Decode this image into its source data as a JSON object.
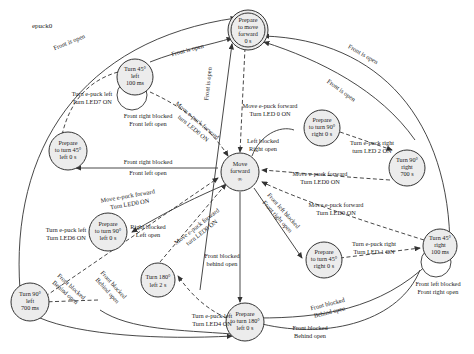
{
  "diagram": {
    "title": "epuck0",
    "type": "state-machine",
    "colors": {
      "node_fill": "#ececec",
      "stroke": "#333333",
      "text": "#222222",
      "background": "#ffffff"
    },
    "nodes": [
      {
        "id": "prepare_forward",
        "lines": [
          "Prepare",
          "to move",
          "forward",
          "0 s"
        ],
        "double": true
      },
      {
        "id": "turn45_left",
        "lines": [
          "Turn 45°",
          "left",
          "100 ms"
        ]
      },
      {
        "id": "prepare45_left",
        "lines": [
          "Prepare",
          "to turn 45°",
          "left 0 s"
        ]
      },
      {
        "id": "move_forward",
        "lines": [
          "Move",
          "forward",
          "∞"
        ]
      },
      {
        "id": "turn90_left",
        "lines": [
          "Turn 90°",
          "left",
          "700 ms"
        ]
      },
      {
        "id": "prepare90_left",
        "lines": [
          "Prepare",
          "to turn 90°",
          "left 0 s"
        ]
      },
      {
        "id": "turn180_left",
        "lines": [
          "Turn 180°",
          "left 2 s"
        ]
      },
      {
        "id": "prepare180_left",
        "lines": [
          "Prepare",
          "to turn 180°",
          "left 0 s"
        ]
      },
      {
        "id": "prepare90_right",
        "lines": [
          "Prepare",
          "to turn 90°",
          "right 0 s"
        ]
      },
      {
        "id": "turn90_right",
        "lines": [
          "Turn 90°",
          "right",
          "700 s"
        ]
      },
      {
        "id": "prepare45_right",
        "lines": [
          "Prepare",
          "to turn 45°",
          "right 0 s"
        ]
      },
      {
        "id": "turn45_right",
        "lines": [
          "Turn 45°",
          "right",
          "100 ms"
        ]
      }
    ],
    "labels": {
      "front_open_outer_left": "Front is open",
      "front_open_t45l": "Front is open",
      "front_open_vertical": "Front is open",
      "front_open_outer_right": "Front is open",
      "front_open_t90r": "Front is open",
      "move_fwd_led0_top": [
        "Move e-puck forward",
        "Turn LED 0 ON"
      ],
      "turn_left_led7": [
        "Turn e-puck left",
        "Turn LED7 ON"
      ],
      "loop_t45l": [
        "Front right blocked",
        "Front left open"
      ],
      "move_fwd_led0_t45l": [
        "Move e-puck forward",
        "turn LED0 ON"
      ],
      "frb_flo_mid": [
        "Front right blocked",
        "Front left open"
      ],
      "move_fwd_led0_t90l": [
        "Move e-puck forward",
        "Turn LED0 ON"
      ],
      "turn_left_led6": [
        "Turn e-puck left",
        "Turn LED6 ON"
      ],
      "right_blocked": [
        "Right blocked",
        "Left open"
      ],
      "move_fwd_led0_t180": [
        "Move e-puck forward",
        "turn LED0 ON"
      ],
      "left_blocked": [
        "Left blocked",
        "Right open"
      ],
      "turn_right_led2": [
        "Turn e-puck right",
        "turn LED 2 ON"
      ],
      "move_fwd_led0_t90r": [
        "Move e-puck forward",
        "Turn LED0 ON"
      ],
      "move_fwd_led0_t45r": [
        "Move e-puck forward",
        "Turn LED0 ON"
      ],
      "flb_fro_diag": [
        "Front left blocked",
        "Front right open"
      ],
      "front_blocked_behind": [
        "Front blocked",
        "behind open"
      ],
      "turn_right_led1": [
        "Turn e-puck right",
        "Turn LED 1 ON"
      ],
      "loop_t45r": [
        "Front left blocked",
        "Front right open"
      ],
      "turn_left_led4": [
        "Turn e-puck left",
        "Turn LED4 ON"
      ],
      "fb_bo_outer1": [
        "Front blocked",
        "Behind open"
      ],
      "fb_bo_outer2": [
        "Front blocked",
        "Behind open"
      ],
      "fb_bo_right1": [
        "Front blocked",
        "Behind open"
      ],
      "fb_bo_right2": [
        "Front blocked",
        "Behind open"
      ]
    }
  }
}
